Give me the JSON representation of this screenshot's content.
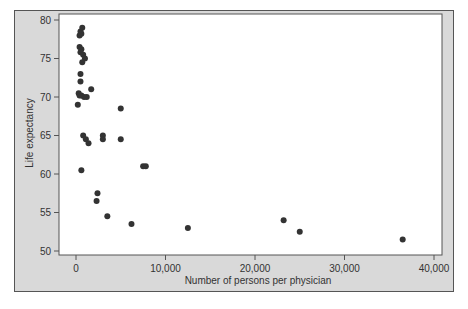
{
  "chart_data": {
    "type": "scatter",
    "title": "",
    "xlabel": "Number of persons per physician",
    "ylabel": "Life expectancy",
    "xlim": [
      -2000,
      41000
    ],
    "ylim": [
      49.5,
      80.5
    ],
    "xticks": [
      0,
      10000,
      20000,
      30000,
      40000
    ],
    "xtick_labels": [
      "0",
      "10,000",
      "20,000",
      "30,000",
      "40,000"
    ],
    "yticks": [
      50,
      55,
      60,
      65,
      70,
      75,
      80
    ],
    "ytick_labels": [
      "50",
      "55",
      "60",
      "65",
      "70",
      "75",
      "80"
    ],
    "grid": false,
    "legend": null,
    "marker_color": "#333333",
    "points": [
      {
        "x": 500,
        "y": 78.5
      },
      {
        "x": 700,
        "y": 79
      },
      {
        "x": 400,
        "y": 78
      },
      {
        "x": 600,
        "y": 78.2
      },
      {
        "x": 400,
        "y": 76.5
      },
      {
        "x": 600,
        "y": 76.2
      },
      {
        "x": 500,
        "y": 75.8
      },
      {
        "x": 800,
        "y": 75.5
      },
      {
        "x": 1000,
        "y": 75
      },
      {
        "x": 700,
        "y": 74.5
      },
      {
        "x": 500,
        "y": 73
      },
      {
        "x": 500,
        "y": 72
      },
      {
        "x": 300,
        "y": 70.5
      },
      {
        "x": 600,
        "y": 70.2
      },
      {
        "x": 900,
        "y": 70
      },
      {
        "x": 1200,
        "y": 70
      },
      {
        "x": 1700,
        "y": 71
      },
      {
        "x": 200,
        "y": 69
      },
      {
        "x": 400,
        "y": 70.2
      },
      {
        "x": 800,
        "y": 65
      },
      {
        "x": 1100,
        "y": 64.5
      },
      {
        "x": 1400,
        "y": 64
      },
      {
        "x": 3000,
        "y": 65
      },
      {
        "x": 3000,
        "y": 64.5
      },
      {
        "x": 5000,
        "y": 68.5
      },
      {
        "x": 5000,
        "y": 64.5
      },
      {
        "x": 600,
        "y": 60.5
      },
      {
        "x": 7500,
        "y": 61
      },
      {
        "x": 7800,
        "y": 61
      },
      {
        "x": 2400,
        "y": 57.5
      },
      {
        "x": 2300,
        "y": 56.5
      },
      {
        "x": 3500,
        "y": 54.5
      },
      {
        "x": 6200,
        "y": 53.5
      },
      {
        "x": 12500,
        "y": 53
      },
      {
        "x": 23200,
        "y": 54
      },
      {
        "x": 25000,
        "y": 52.5
      },
      {
        "x": 36500,
        "y": 51.5
      }
    ]
  }
}
